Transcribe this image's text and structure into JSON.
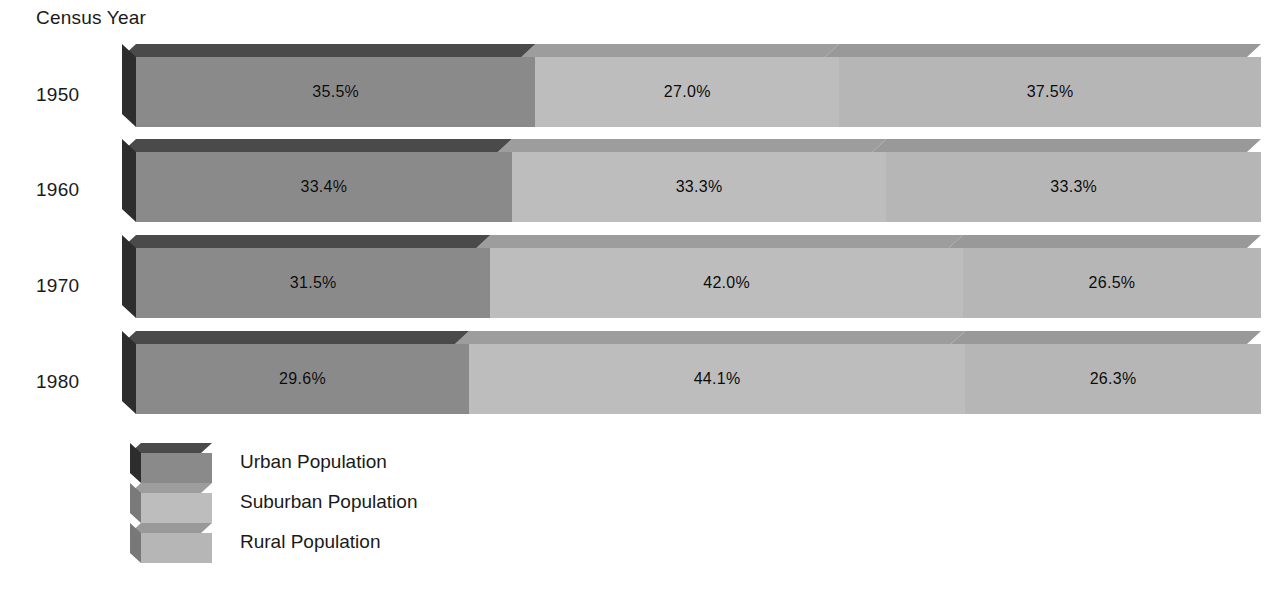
{
  "axis": {
    "title": "Census Year"
  },
  "chart_data": {
    "type": "bar",
    "subtype": "stacked-horizontal-100-percent-3d",
    "title": "Census Year",
    "xlabel": "",
    "ylabel": "Census Year",
    "xlim": [
      0,
      100
    ],
    "grid": false,
    "legend_position": "bottom-left",
    "unit": "%",
    "categories": [
      "1950",
      "1960",
      "1970",
      "1980"
    ],
    "series": [
      {
        "name": "Urban Population",
        "color": "#8a8a8a",
        "top_color": "#4a4a4a",
        "side_color": "#2d2d2d",
        "values": [
          35.5,
          33.4,
          31.5,
          29.6
        ],
        "labels": [
          "35.5%",
          "33.4%",
          "31.5%",
          "29.6%"
        ]
      },
      {
        "name": "Suburban Population",
        "color": "#bdbdbd",
        "top_color": "#9d9d9d",
        "side_color": "#7a7a7a",
        "values": [
          27.0,
          33.3,
          42.0,
          44.1
        ],
        "labels": [
          "27.0%",
          "33.3%",
          "42.0%",
          "44.1%"
        ]
      },
      {
        "name": "Rural Population",
        "color": "#b6b6b6",
        "top_color": "#999999",
        "side_color": "#787878",
        "values": [
          37.5,
          33.3,
          26.5,
          26.3
        ],
        "labels": [
          "37.5%",
          "33.3%",
          "26.5%",
          "26.3%"
        ]
      }
    ],
    "rows": [
      {
        "year": "1950",
        "segments": [
          {
            "series": "Urban Population",
            "value": 35.5,
            "label": "35.5%"
          },
          {
            "series": "Suburban Population",
            "value": 27.0,
            "label": "27.0%"
          },
          {
            "series": "Rural Population",
            "value": 37.5,
            "label": "37.5%"
          }
        ]
      },
      {
        "year": "1960",
        "segments": [
          {
            "series": "Urban Population",
            "value": 33.4,
            "label": "33.4%"
          },
          {
            "series": "Suburban Population",
            "value": 33.3,
            "label": "33.3%"
          },
          {
            "series": "Rural Population",
            "value": 33.3,
            "label": "33.3%"
          }
        ]
      },
      {
        "year": "1970",
        "segments": [
          {
            "series": "Urban Population",
            "value": 31.5,
            "label": "31.5%"
          },
          {
            "series": "Suburban Population",
            "value": 42.0,
            "label": "42.0%"
          },
          {
            "series": "Rural Population",
            "value": 26.5,
            "label": "26.5%"
          }
        ]
      },
      {
        "year": "1980",
        "segments": [
          {
            "series": "Urban Population",
            "value": 29.6,
            "label": "29.6%"
          },
          {
            "series": "Suburban Population",
            "value": 44.1,
            "label": "44.1%"
          },
          {
            "series": "Rural Population",
            "value": 26.3,
            "label": "26.3%"
          }
        ]
      }
    ]
  },
  "legend": {
    "items": [
      {
        "label": "Urban Population",
        "swatch": "urban-swatch"
      },
      {
        "label": "Suburban Population",
        "swatch": "suburban-swatch"
      },
      {
        "label": "Rural Population",
        "swatch": "rural-swatch"
      }
    ]
  }
}
